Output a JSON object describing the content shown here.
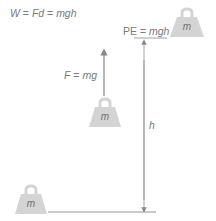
{
  "equation_top": {
    "w": "W",
    "eq1": " = ",
    "fd": "Fd",
    "eq2": " = ",
    "mgh": "mgh"
  },
  "pe_label": {
    "pe": "PE",
    "eq": " = ",
    "mgh": "mgh"
  },
  "force_label": {
    "f": "F",
    "eq": " = ",
    "mg": "mg"
  },
  "height_label": "h",
  "weights": [
    {
      "position": "top-right",
      "label": "m"
    },
    {
      "position": "middle",
      "label": "m"
    },
    {
      "position": "bottom-left",
      "label": "m"
    }
  ],
  "colors": {
    "weight_fill": "#d4d4d4",
    "line": "#888888",
    "text": "#7a7a7a"
  }
}
